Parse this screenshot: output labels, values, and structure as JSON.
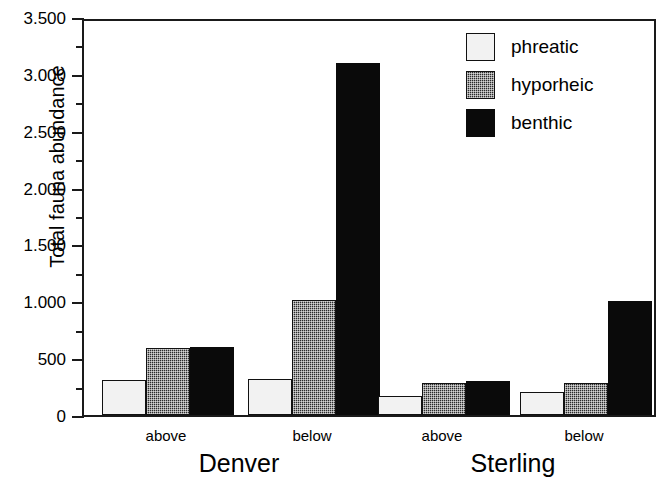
{
  "chart_data": {
    "type": "bar",
    "title": "",
    "xlabel": "",
    "ylabel": "Total fauna abundance",
    "ylim": [
      0,
      3500
    ],
    "grid": false,
    "legend_position": "top-right",
    "categories": [
      "Denver above",
      "Denver below",
      "Sterling above",
      "Sterling below"
    ],
    "groups": [
      {
        "name": "Denver",
        "subcategories": [
          "above",
          "below"
        ]
      },
      {
        "name": "Sterling",
        "subcategories": [
          "above",
          "below"
        ]
      }
    ],
    "series": [
      {
        "name": "phreatic",
        "fill": "light",
        "values": [
          310,
          320,
          165,
          200
        ]
      },
      {
        "name": "hyporheic",
        "fill": "stippled",
        "values": [
          590,
          1010,
          280,
          280
        ]
      },
      {
        "name": "benthic",
        "fill": "solid",
        "values": [
          600,
          3100,
          295,
          1005
        ]
      }
    ],
    "y_ticks_major": [
      0,
      500,
      1000,
      1500,
      2000,
      2500,
      3000,
      3500
    ],
    "y_tick_labels": [
      "0",
      "500",
      "1.000",
      "1.500",
      "2.000",
      "2.500",
      "3.000",
      "3.500"
    ],
    "y_ticks_minor": [
      250,
      750,
      1250,
      1750,
      2250,
      2750,
      3250
    ]
  },
  "legend": {
    "items": [
      {
        "label": "phreatic",
        "key": "phreatic"
      },
      {
        "label": "hyporheic",
        "key": "hyporheic"
      },
      {
        "label": "benthic",
        "key": "benthic"
      }
    ]
  },
  "colors": {
    "phreatic": "#f2f2f2",
    "hyporheic": "#2b2b2b",
    "benthic": "#0a0a0a",
    "axis": "#1a1a1a",
    "background": "#ffffff"
  }
}
